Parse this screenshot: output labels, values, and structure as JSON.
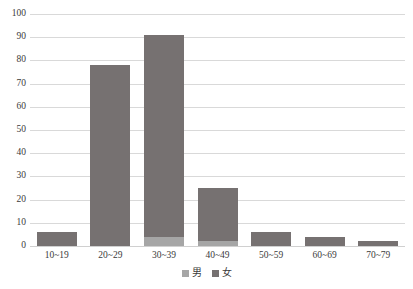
{
  "chart_data": {
    "type": "bar",
    "title": "",
    "subtitle": "",
    "xlabel": "",
    "ylabel": "",
    "stacked": true,
    "grid": true,
    "legend_position": "bottom-center",
    "ylim": [
      0,
      100
    ],
    "ytick_step": 10,
    "yticks": [
      "100",
      "90",
      "80",
      "70",
      "60",
      "50",
      "40",
      "30",
      "20",
      "10",
      "0"
    ],
    "categories": [
      "10~19",
      "20~29",
      "30~39",
      "40~49",
      "50~59",
      "60~69",
      "70~79"
    ],
    "series": [
      {
        "name": "男",
        "color": "#a6a6a6",
        "values": [
          0,
          0,
          4,
          2,
          0,
          0,
          0
        ]
      },
      {
        "name": "女",
        "color": "#767171",
        "values": [
          6,
          78,
          87,
          23,
          6,
          4,
          2
        ]
      }
    ],
    "totals": [
      6,
      78,
      91,
      25,
      6,
      4,
      2
    ]
  },
  "legend": {
    "items": [
      {
        "label": "男",
        "color": "#a6a6a6"
      },
      {
        "label": "女",
        "color": "#767171"
      }
    ]
  },
  "colors": {
    "gridline": "#d9d9d9",
    "text": "#3b3b3b",
    "background": "#ffffff"
  }
}
